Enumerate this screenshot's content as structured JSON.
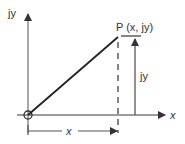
{
  "diagram": {
    "type": "complex-plane-vector",
    "colors": {
      "axis": "#7a7a7a",
      "vector": "#222222",
      "text": "#333333",
      "dimension": "#555555"
    },
    "labels": {
      "y_axis": "jy",
      "x_axis": "x",
      "point": "P (x, jy)",
      "vertical_dimension": "jy",
      "horizontal_dimension": "x"
    },
    "geometry": {
      "origin": [
        28,
        115
      ],
      "point_P": [
        118,
        37
      ],
      "y_axis_top": 12,
      "x_axis_right": 165
    }
  }
}
